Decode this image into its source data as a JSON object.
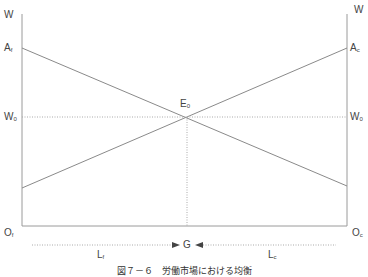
{
  "diagram": {
    "type": "labor-market-equilibrium",
    "caption": "図７－６　労働市場における均衡",
    "left_axis": {
      "label": "W",
      "origin": "O",
      "origin_sub": "f"
    },
    "right_axis": {
      "label": "W",
      "origin": "O",
      "origin_sub": "c"
    },
    "intercepts": {
      "left": {
        "label": "A",
        "sub": "f"
      },
      "right": {
        "label": "A",
        "sub": "c"
      }
    },
    "equilibrium": {
      "label": "E",
      "sub": "0"
    },
    "wage_left": {
      "label": "W",
      "sub": "0"
    },
    "wage_right": {
      "label": "W",
      "sub": "0"
    },
    "bottom": {
      "left_label": "L",
      "left_sub": "f",
      "right_label": "L",
      "right_sub": "c",
      "center_label": "G"
    },
    "colors": {
      "axis": "#9a9a9a",
      "line": "#8a8a8a",
      "dotted": "#aaaaaa",
      "text": "#444444"
    }
  }
}
